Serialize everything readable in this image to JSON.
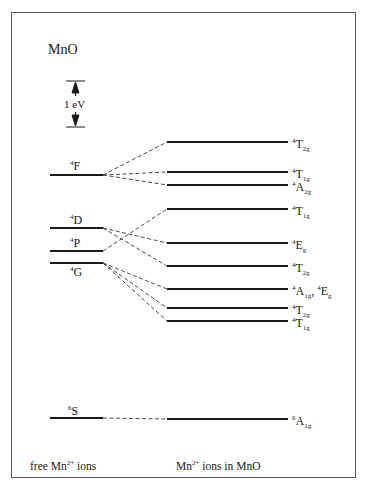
{
  "diagram": {
    "title": "MnO",
    "scale_bar": {
      "label": "1 eV"
    },
    "free_ion_levels": [
      {
        "name": "F",
        "mult": "4",
        "y": 175
      },
      {
        "name": "D",
        "mult": "4",
        "y": 228
      },
      {
        "name": "P",
        "mult": "4",
        "y": 251
      },
      {
        "name": "G",
        "mult": "4",
        "y": 263
      },
      {
        "name": "S",
        "mult": "6",
        "y": 418
      }
    ],
    "crystal_field_levels": [
      {
        "mult": "4",
        "sym": "T",
        "sub": "2g",
        "y": 142
      },
      {
        "mult": "4",
        "sym": "T",
        "sub": "1g",
        "y": 172
      },
      {
        "mult": "4",
        "sym": "A",
        "sub": "2g",
        "y": 185
      },
      {
        "mult": "4",
        "sym": "T",
        "sub": "1g",
        "y": 209
      },
      {
        "mult": "4",
        "sym": "E",
        "sub": "g",
        "y": 243
      },
      {
        "mult": "4",
        "sym": "T",
        "sub": "2g",
        "y": 266
      },
      {
        "mult": "4",
        "sym": "A",
        "sub": "1g",
        "extra": ", ",
        "mult2": "4",
        "sym2": "E",
        "sub2": "g",
        "y": 289
      },
      {
        "mult": "4",
        "sym": "T",
        "sub": "2g",
        "y": 308
      },
      {
        "mult": "4",
        "sym": "T",
        "sub": "1g",
        "y": 321
      },
      {
        "mult": "6",
        "sym": "A",
        "sub": "1g",
        "y": 419
      }
    ],
    "correlations": [
      [
        "F",
        0
      ],
      [
        "F",
        1
      ],
      [
        "F",
        2
      ],
      [
        "P",
        3
      ],
      [
        "D",
        4
      ],
      [
        "D",
        5
      ],
      [
        "G",
        6
      ],
      [
        "G",
        7
      ],
      [
        "G",
        8
      ],
      [
        "S",
        9
      ]
    ],
    "footer": {
      "left_pre": "free Mn",
      "left_sup": "2+",
      "left_post": " ions",
      "right_pre": "Mn",
      "right_sup": "2+",
      "right_post": " ions in MnO"
    }
  }
}
